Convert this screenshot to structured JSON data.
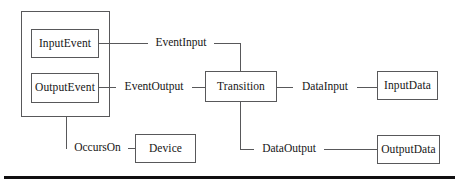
{
  "diagram": {
    "colors": {
      "stroke": "#58585a",
      "text": "#161616",
      "background": "#ffffff",
      "rule": "#100f10"
    },
    "group_container": {
      "name": "event-group-container",
      "label": ""
    },
    "nodes": [
      {
        "id": "input-event",
        "label": "InputEvent"
      },
      {
        "id": "output-event",
        "label": "OutputEvent"
      },
      {
        "id": "transition",
        "label": "Transition"
      },
      {
        "id": "device",
        "label": "Device"
      },
      {
        "id": "input-data",
        "label": "InputData"
      },
      {
        "id": "output-data",
        "label": "OutputData"
      }
    ],
    "edges": [
      {
        "id": "event-input",
        "label": "EventInput",
        "from": "input-event",
        "to": "transition"
      },
      {
        "id": "event-output",
        "label": "EventOutput",
        "from": "output-event",
        "to": "transition"
      },
      {
        "id": "occurs-on",
        "label": "OccursOn",
        "from": "event-group-container",
        "to": "device"
      },
      {
        "id": "data-input",
        "label": "DataInput",
        "from": "transition",
        "to": "input-data"
      },
      {
        "id": "data-output",
        "label": "DataOutput",
        "from": "transition",
        "to": "output-data"
      }
    ],
    "footer_rule": {
      "name": "footer-rule"
    }
  }
}
